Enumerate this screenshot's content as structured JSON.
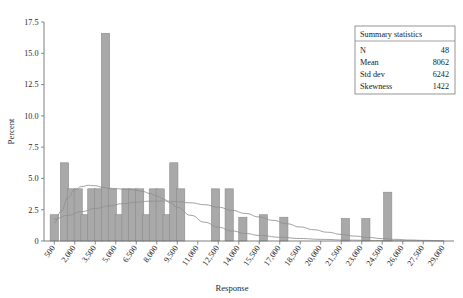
{
  "chart_data": {
    "type": "bar",
    "title": "",
    "subtitle": "",
    "xlabel": "Response",
    "ylabel": "Percent",
    "xlim": [
      -250,
      29750
    ],
    "ylim": [
      0,
      17.5
    ],
    "grid": false,
    "legend_position": "none",
    "bin_width": 1500,
    "x_tick_labels": [
      "500",
      "2,000",
      "3,500",
      "5,000",
      "6,500",
      "8,000",
      "9,500",
      "11,000",
      "12,500",
      "14,000",
      "15,500",
      "17,000",
      "18,500",
      "20,000",
      "21,500",
      "23,000",
      "24,500",
      "26,000",
      "27,500",
      "29,000"
    ],
    "x_tick_values": [
      500,
      2000,
      3500,
      5000,
      6500,
      8000,
      9500,
      11000,
      12500,
      14000,
      15500,
      17000,
      18500,
      20000,
      21500,
      23000,
      24500,
      26000,
      27500,
      29000
    ],
    "y_tick_labels": [
      "0",
      "2.5",
      "5.0",
      "7.5",
      "10.0",
      "12.5",
      "15.0",
      "17.5"
    ],
    "y_tick_values": [
      0,
      2.5,
      5.0,
      7.5,
      10.0,
      12.5,
      15.0,
      17.5
    ],
    "categories": [
      500,
      1000,
      1500,
      2000,
      2500,
      3000,
      3500,
      4000,
      4500,
      5000,
      5500,
      6000,
      6500,
      7000,
      7500,
      8000,
      8500,
      9000,
      9500,
      10000,
      12000,
      12900,
      14200,
      15600,
      17000,
      18600,
      21700,
      23200,
      24600
    ],
    "values": [
      2.1,
      6.25,
      4.17,
      4.17,
      2.1,
      4.17,
      4.17,
      16.6,
      4.17,
      2.1,
      4.17,
      4.17,
      4.17,
      2.1,
      4.17,
      4.17,
      2.1,
      6.25,
      4.17,
      0,
      4.17,
      4.17,
      1.9,
      2.1,
      1.9,
      1.9,
      1.8,
      1.8,
      3.9
    ],
    "bars": [
      {
        "x": 500,
        "height": 2.1
      },
      {
        "x": 1250,
        "height": 6.25
      },
      {
        "x": 1750,
        "height": 4.17
      },
      {
        "x": 2250,
        "height": 4.17
      },
      {
        "x": 2750,
        "height": 2.1
      },
      {
        "x": 3250,
        "height": 4.17
      },
      {
        "x": 3750,
        "height": 4.17
      },
      {
        "x": 4250,
        "height": 16.6
      },
      {
        "x": 4750,
        "height": 4.17
      },
      {
        "x": 5250,
        "height": 2.1
      },
      {
        "x": 5750,
        "height": 4.17
      },
      {
        "x": 6250,
        "height": 4.17
      },
      {
        "x": 6750,
        "height": 4.17
      },
      {
        "x": 7250,
        "height": 2.1
      },
      {
        "x": 7750,
        "height": 4.17
      },
      {
        "x": 8250,
        "height": 4.17
      },
      {
        "x": 8750,
        "height": 2.1
      },
      {
        "x": 9250,
        "height": 6.25
      },
      {
        "x": 9750,
        "height": 4.17
      },
      {
        "x": 12300,
        "height": 4.17
      },
      {
        "x": 13300,
        "height": 4.17
      },
      {
        "x": 14300,
        "height": 1.9
      },
      {
        "x": 15800,
        "height": 2.1
      },
      {
        "x": 17300,
        "height": 1.9
      },
      {
        "x": 21800,
        "height": 1.8
      },
      {
        "x": 23300,
        "height": 1.8
      },
      {
        "x": 24900,
        "height": 3.9
      }
    ],
    "curves": [
      {
        "name": "kernel-density",
        "points": [
          [
            500,
            1.45
          ],
          [
            1000,
            2.35
          ],
          [
            1500,
            3.45
          ],
          [
            2000,
            4.1
          ],
          [
            2500,
            4.35
          ],
          [
            3000,
            4.45
          ],
          [
            3500,
            4.42
          ],
          [
            4000,
            4.3
          ],
          [
            4500,
            4.22
          ],
          [
            5000,
            4.18
          ],
          [
            5500,
            4.15
          ],
          [
            6000,
            4.12
          ],
          [
            6500,
            4.05
          ],
          [
            7000,
            3.95
          ],
          [
            7500,
            3.8
          ],
          [
            8000,
            3.6
          ],
          [
            8500,
            3.35
          ],
          [
            9000,
            3.05
          ],
          [
            9500,
            2.7
          ],
          [
            10500,
            2.05
          ],
          [
            11500,
            1.5
          ],
          [
            12500,
            1.1
          ],
          [
            13500,
            0.8
          ],
          [
            14500,
            0.6
          ],
          [
            15500,
            0.45
          ],
          [
            17000,
            0.3
          ],
          [
            18500,
            0.2
          ],
          [
            20000,
            0.13
          ],
          [
            22000,
            0.07
          ],
          [
            24000,
            0.04
          ],
          [
            26000,
            0.02
          ],
          [
            29000,
            0.01
          ]
        ]
      },
      {
        "name": "normal-fit",
        "points": [
          [
            500,
            1.75
          ],
          [
            1500,
            2.05
          ],
          [
            2500,
            2.35
          ],
          [
            3500,
            2.6
          ],
          [
            4500,
            2.8
          ],
          [
            5500,
            2.98
          ],
          [
            6500,
            3.1
          ],
          [
            7500,
            3.18
          ],
          [
            8500,
            3.2
          ],
          [
            9500,
            3.15
          ],
          [
            10500,
            3.05
          ],
          [
            11500,
            2.9
          ],
          [
            12500,
            2.7
          ],
          [
            13500,
            2.45
          ],
          [
            14500,
            2.2
          ],
          [
            15500,
            1.92
          ],
          [
            16500,
            1.65
          ],
          [
            17500,
            1.38
          ],
          [
            18500,
            1.12
          ],
          [
            19500,
            0.9
          ],
          [
            20500,
            0.7
          ],
          [
            21500,
            0.53
          ],
          [
            22500,
            0.39
          ],
          [
            23500,
            0.28
          ],
          [
            24500,
            0.19
          ],
          [
            25500,
            0.13
          ],
          [
            26500,
            0.08
          ],
          [
            27500,
            0.05
          ],
          [
            29000,
            0.02
          ]
        ]
      }
    ]
  },
  "summary_box": {
    "title": "Summary statistics",
    "rows": [
      {
        "label": "N",
        "value": "48"
      },
      {
        "label": "Mean",
        "value": "8062"
      },
      {
        "label": "Std dev",
        "value": "6242"
      },
      {
        "label": "Skewness",
        "value": "1422"
      }
    ]
  }
}
